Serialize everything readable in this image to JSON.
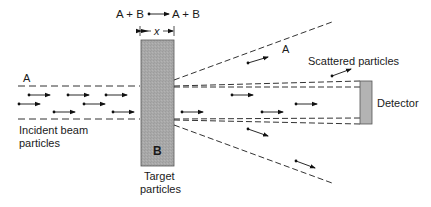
{
  "diagram": {
    "reaction": {
      "left": "A + B",
      "right": "A + B"
    },
    "thickness_label": "x",
    "beam_label": "A",
    "scattered_label_A": "A",
    "scattered_particles_label": "Scattered particles",
    "detector_label": "Detector",
    "incident_label_line1": "Incident beam",
    "incident_label_line2": "particles",
    "target_block_label": "B",
    "target_label_line1": "Target",
    "target_label_line2": "particles",
    "colors": {
      "target_fill": "#a9a9a9",
      "detector_fill": "#b5b5b5",
      "line": "#333333"
    }
  }
}
